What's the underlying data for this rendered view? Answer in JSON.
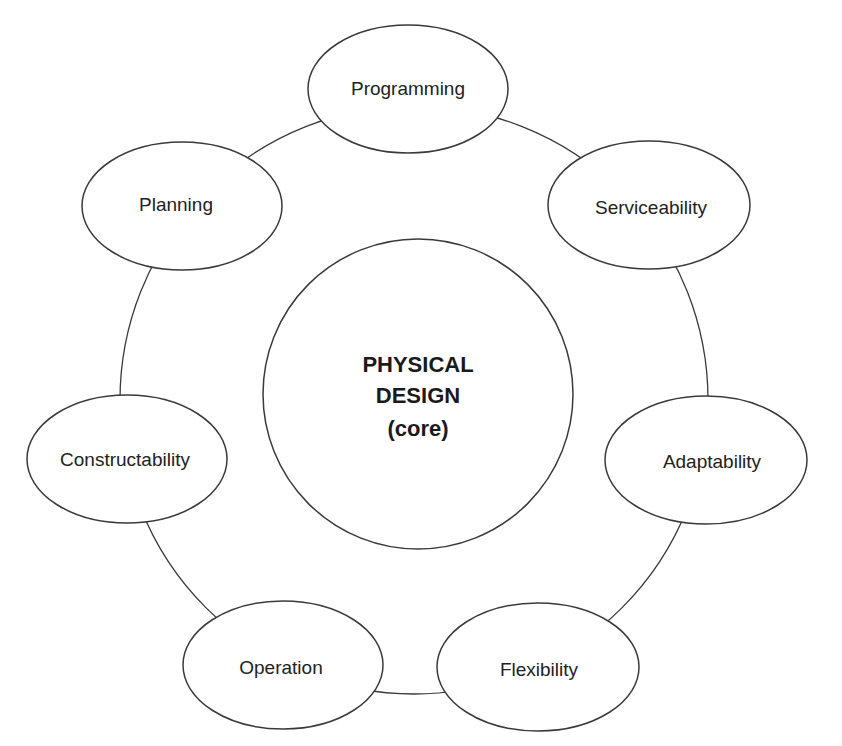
{
  "diagram": {
    "type": "cycle-with-core",
    "core": {
      "lines": [
        "PHYSICAL",
        "DESIGN",
        "(core)"
      ]
    },
    "nodes": [
      {
        "label": "Programming"
      },
      {
        "label": "Serviceability"
      },
      {
        "label": "Adaptability"
      },
      {
        "label": "Flexibility"
      },
      {
        "label": "Operation"
      },
      {
        "label": "Constructability"
      },
      {
        "label": "Planning"
      }
    ],
    "colors": {
      "stroke": "#3a3a3a",
      "text": "#222222",
      "background": "#ffffff"
    }
  }
}
